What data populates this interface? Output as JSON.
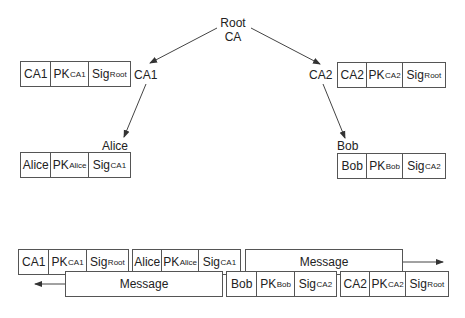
{
  "root": {
    "line1": "Root",
    "line2": "CA"
  },
  "nodes": {
    "ca1": "CA1",
    "ca2": "CA2",
    "alice": "Alice",
    "bob": "Bob"
  },
  "certificates": {
    "ca1": {
      "subject": "CA1",
      "key": "PK",
      "key_sub": "CA1",
      "sig": "Sig",
      "sig_sub": "Root"
    },
    "ca2": {
      "subject": "CA2",
      "key": "PK",
      "key_sub": "CA2",
      "sig": "Sig",
      "sig_sub": "Root"
    },
    "alice": {
      "subject": "Alice",
      "key": "PK",
      "key_sub": "Alice",
      "sig": "Sig",
      "sig_sub": "CA1"
    },
    "bob": {
      "subject": "Bob",
      "key": "PK",
      "key_sub": "Bob",
      "sig": "Sig",
      "sig_sub": "CA2"
    }
  },
  "messages": {
    "outgoing": "Message",
    "incoming": "Message"
  },
  "colors": {
    "line": "#444444",
    "border": "#555555",
    "text": "#222222"
  }
}
